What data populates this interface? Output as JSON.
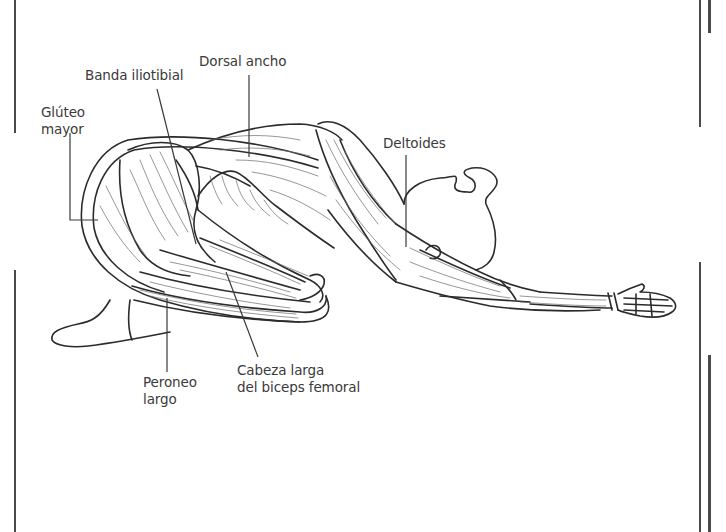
{
  "figure": {
    "stroke_color": "#2b2b2b",
    "label_color": "#3a3a3a",
    "background": "#ffffff"
  },
  "labels": {
    "dorsal_ancho": {
      "line1": "Dorsal ancho"
    },
    "banda_iliotibial": {
      "line1": "Banda iliotibial"
    },
    "gluteo_mayor": {
      "line1": "Glúteo",
      "line2": "mayor"
    },
    "deltoides": {
      "line1": "Deltoides"
    },
    "peroneo_largo": {
      "line1": "Peroneo",
      "line2": "largo"
    },
    "cabeza_larga": {
      "line1": "Cabeza larga",
      "line2": "del biceps femoral"
    }
  }
}
